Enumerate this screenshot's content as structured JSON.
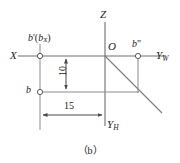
{
  "figure": {
    "caption": "（b）",
    "labels": {
      "x_axis": "X",
      "z_axis": "Z",
      "yw_axis_base": "Y",
      "yw_axis_sub": "W",
      "yh_axis_base": "Y",
      "yh_axis_sub": "H",
      "origin": "O",
      "point_b_front_base": "b",
      "point_b_front_prime": "'",
      "point_b_front_paren_open": "(",
      "point_b_front_axis_base": "b",
      "point_b_front_axis_sub": "X",
      "point_b_front_paren_close": ")",
      "point_b_top": "b",
      "point_b_side_base": "b",
      "point_b_side_prime": "\"",
      "dimension_vertical": "10",
      "dimension_horizontal": "15"
    },
    "colors": {
      "line": "#7a7a7a",
      "axis": "#6e6e6e",
      "text": "#1a1a1a",
      "marker_stroke": "#5a5a5a",
      "background": "#ffffff"
    },
    "geometry": {
      "origin_px": [
        105,
        56
      ],
      "point_b_front_px": [
        40,
        56
      ],
      "point_b_top_px": [
        40,
        92
      ],
      "point_b_side_px": [
        138,
        56
      ],
      "corner_px": [
        138,
        92
      ],
      "dimension_vertical_value": 10,
      "dimension_horizontal_value": 15,
      "projection_angle_deg": 45
    }
  }
}
